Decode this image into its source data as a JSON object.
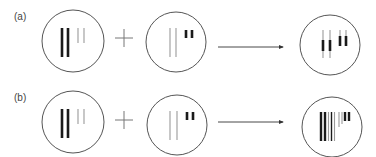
{
  "panels": [
    {
      "label": "(a)",
      "operator": "+",
      "description": "Combination where short segments overlay onto long segments"
    },
    {
      "label": "(b)",
      "operator": "+",
      "description": "Combination where segments are placed side by side"
    }
  ],
  "colors": {
    "thick": "#1a1a1a",
    "thin": "#9a9a9a",
    "circle": "#555555",
    "arrow": "#333333"
  }
}
